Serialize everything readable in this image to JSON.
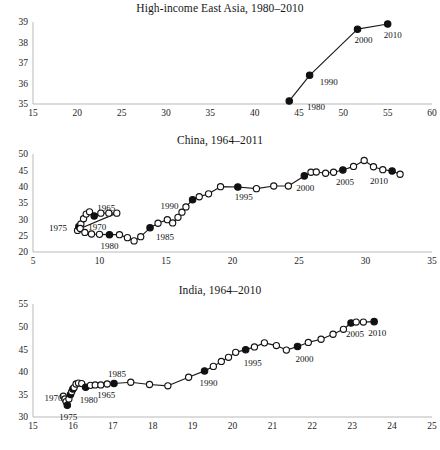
{
  "figure": {
    "background_color": "#ffffff",
    "line_color": "#1a1a1a",
    "marker_open_fill": "#ffffff",
    "marker_filled_fill": "#111111",
    "axis_color": "#b9b9b9"
  },
  "panels": [
    {
      "id": "high-income-east-asia",
      "title": "High-income East Asia, 1980–2010",
      "xticks": [
        "15",
        "20",
        "25",
        "30",
        "35",
        "40",
        "45",
        "50",
        "55",
        "60"
      ],
      "yticks": [
        "35",
        "36",
        "37",
        "38",
        "39"
      ]
    },
    {
      "id": "china",
      "title": "China, 1964–2011",
      "xticks": [
        "5",
        "10",
        "15",
        "20",
        "25",
        "30",
        "35"
      ],
      "yticks": [
        "20",
        "25",
        "30",
        "35",
        "40",
        "45",
        "50"
      ]
    },
    {
      "id": "india",
      "title": "India, 1964–2010",
      "xticks": [
        "15",
        "16",
        "17",
        "18",
        "19",
        "20",
        "21",
        "22",
        "23",
        "24",
        "25"
      ],
      "yticks": [
        "30",
        "35",
        "40",
        "45",
        "50",
        "55"
      ]
    }
  ],
  "chart_data": [
    {
      "type": "line",
      "title": "High-income East Asia, 1980–2010",
      "xlabel": "",
      "ylabel": "",
      "xlim": [
        15,
        60
      ],
      "ylim": [
        35,
        39
      ],
      "xticks": [
        15,
        20,
        25,
        30,
        35,
        40,
        45,
        50,
        55,
        60
      ],
      "yticks": [
        35,
        36,
        37,
        38,
        39
      ],
      "grid": false,
      "legend": "none",
      "marker_styles": {
        "open": "unlabeled year",
        "filled": "labeled decade marker"
      },
      "series": [
        {
          "name": "High-income East Asia",
          "points": [
            {
              "x": 43.9,
              "y": 35.15,
              "filled": true,
              "label": "1980"
            },
            {
              "x": 46.2,
              "y": 36.4,
              "filled": true,
              "label": "1990"
            },
            {
              "x": 51.6,
              "y": 38.65,
              "filled": true,
              "label": "2000"
            },
            {
              "x": 55.0,
              "y": 38.9,
              "filled": true,
              "label": "2010"
            }
          ]
        }
      ],
      "annotations": [
        "1980",
        "1990",
        "2000",
        "2010"
      ]
    },
    {
      "type": "line",
      "title": "China, 1964–2011",
      "xlabel": "",
      "ylabel": "",
      "xlim": [
        5,
        35
      ],
      "ylim": [
        20,
        50
      ],
      "xticks": [
        5,
        10,
        15,
        20,
        25,
        30,
        35
      ],
      "yticks": [
        20,
        25,
        30,
        35,
        40,
        45,
        50
      ],
      "grid": false,
      "legend": "none",
      "marker_styles": {
        "open": "unlabeled year",
        "filled": "labeled 5-year marker"
      },
      "series": [
        {
          "name": "China",
          "points": [
            {
              "x": 8.35,
              "y": 26.6,
              "filled": false,
              "label": null
            },
            {
              "x": 8.45,
              "y": 27.8,
              "filled": true,
              "label": "1975"
            },
            {
              "x": 8.6,
              "y": 28.6,
              "filled": false,
              "label": null
            },
            {
              "x": 8.8,
              "y": 30.2,
              "filled": false,
              "label": null
            },
            {
              "x": 9.0,
              "y": 31.6,
              "filled": false,
              "label": null
            },
            {
              "x": 9.25,
              "y": 32.3,
              "filled": false,
              "label": null
            },
            {
              "x": 9.6,
              "y": 31.0,
              "filled": true,
              "label": "1965"
            },
            {
              "x": 10.1,
              "y": 31.9,
              "filled": false,
              "label": null
            },
            {
              "x": 10.7,
              "y": 31.9,
              "filled": false,
              "label": null
            },
            {
              "x": 11.3,
              "y": 31.9,
              "filled": false,
              "label": null
            },
            {
              "x": 8.55,
              "y": 27.2,
              "filled": false,
              "label": null
            },
            {
              "x": 8.9,
              "y": 26.0,
              "filled": false,
              "label": null
            },
            {
              "x": 9.4,
              "y": 25.5,
              "filled": false,
              "label": null
            },
            {
              "x": 10.0,
              "y": 25.4,
              "filled": false,
              "label": null
            },
            {
              "x": 10.75,
              "y": 25.3,
              "filled": true,
              "label": "1980"
            },
            {
              "x": 11.5,
              "y": 25.3,
              "filled": false,
              "label": null
            },
            {
              "x": 12.1,
              "y": 24.4,
              "filled": false,
              "label": null
            },
            {
              "x": 12.6,
              "y": 23.4,
              "filled": false,
              "label": null
            },
            {
              "x": 13.1,
              "y": 24.7,
              "filled": false,
              "label": null
            },
            {
              "x": 13.8,
              "y": 27.4,
              "filled": true,
              "label": "1985"
            },
            {
              "x": 14.4,
              "y": 28.8,
              "filled": false,
              "label": null
            },
            {
              "x": 15.1,
              "y": 29.9,
              "filled": false,
              "label": null
            },
            {
              "x": 15.5,
              "y": 28.9,
              "filled": false,
              "label": null
            },
            {
              "x": 15.9,
              "y": 30.6,
              "filled": false,
              "label": null
            },
            {
              "x": 16.2,
              "y": 32.2,
              "filled": false,
              "label": null
            },
            {
              "x": 16.5,
              "y": 33.8,
              "filled": false,
              "label": null
            },
            {
              "x": 17.0,
              "y": 36.0,
              "filled": true,
              "label": "1990"
            },
            {
              "x": 17.5,
              "y": 36.9,
              "filled": false,
              "label": null
            },
            {
              "x": 18.2,
              "y": 37.8,
              "filled": false,
              "label": null
            },
            {
              "x": 19.1,
              "y": 40.0,
              "filled": false,
              "label": null
            },
            {
              "x": 20.4,
              "y": 39.9,
              "filled": true,
              "label": "1995"
            },
            {
              "x": 21.8,
              "y": 39.4,
              "filled": false,
              "label": null
            },
            {
              "x": 23.1,
              "y": 40.2,
              "filled": false,
              "label": null
            },
            {
              "x": 24.2,
              "y": 40.2,
              "filled": false,
              "label": null
            },
            {
              "x": 25.4,
              "y": 43.3,
              "filled": true,
              "label": "2000"
            },
            {
              "x": 25.9,
              "y": 44.4,
              "filled": false,
              "label": null
            },
            {
              "x": 26.3,
              "y": 44.5,
              "filled": false,
              "label": null
            },
            {
              "x": 27.0,
              "y": 44.1,
              "filled": false,
              "label": null
            },
            {
              "x": 27.6,
              "y": 44.4,
              "filled": false,
              "label": null
            },
            {
              "x": 28.3,
              "y": 45.1,
              "filled": true,
              "label": "2005"
            },
            {
              "x": 29.1,
              "y": 46.2,
              "filled": false,
              "label": null
            },
            {
              "x": 29.9,
              "y": 48.0,
              "filled": false,
              "label": null
            },
            {
              "x": 30.6,
              "y": 46.1,
              "filled": false,
              "label": null
            },
            {
              "x": 31.3,
              "y": 45.2,
              "filled": false,
              "label": null
            },
            {
              "x": 32.0,
              "y": 44.8,
              "filled": true,
              "label": "2010"
            },
            {
              "x": 32.6,
              "y": 43.8,
              "filled": false,
              "label": null
            }
          ]
        }
      ],
      "annotations": [
        "1965",
        "1970",
        "1975",
        "1980",
        "1985",
        "1990",
        "1995",
        "2000",
        "2005",
        "2010"
      ]
    },
    {
      "type": "line",
      "title": "India, 1964–2010",
      "xlabel": "",
      "ylabel": "",
      "xlim": [
        15,
        25
      ],
      "ylim": [
        30,
        55
      ],
      "xticks": [
        15,
        16,
        17,
        18,
        19,
        20,
        21,
        22,
        23,
        24,
        25
      ],
      "yticks": [
        30,
        35,
        40,
        45,
        50,
        55
      ],
      "grid": false,
      "legend": "none",
      "marker_styles": {
        "open": "unlabeled year",
        "filled": "labeled 5-year marker"
      },
      "series": [
        {
          "name": "India",
          "points": [
            {
              "x": 15.76,
              "y": 34.6,
              "filled": false,
              "label": null
            },
            {
              "x": 15.8,
              "y": 34.0,
              "filled": false,
              "label": null
            },
            {
              "x": 15.83,
              "y": 33.4,
              "filled": false,
              "label": null
            },
            {
              "x": 15.86,
              "y": 32.6,
              "filled": true,
              "label": "1975"
            },
            {
              "x": 15.9,
              "y": 34.0,
              "filled": false,
              "label": null
            },
            {
              "x": 15.94,
              "y": 35.0,
              "filled": true,
              "label": "1970"
            },
            {
              "x": 15.97,
              "y": 35.6,
              "filled": false,
              "label": null
            },
            {
              "x": 16.0,
              "y": 36.2,
              "filled": true,
              "label": null
            },
            {
              "x": 16.03,
              "y": 36.5,
              "filled": false,
              "label": null
            },
            {
              "x": 16.08,
              "y": 37.3,
              "filled": false,
              "label": null
            },
            {
              "x": 16.14,
              "y": 37.5,
              "filled": false,
              "label": null
            },
            {
              "x": 16.22,
              "y": 37.4,
              "filled": false,
              "label": null
            },
            {
              "x": 16.32,
              "y": 36.6,
              "filled": true,
              "label": "1980"
            },
            {
              "x": 16.44,
              "y": 37.0,
              "filled": false,
              "label": null
            },
            {
              "x": 16.56,
              "y": 37.1,
              "filled": false,
              "label": null
            },
            {
              "x": 16.7,
              "y": 37.1,
              "filled": false,
              "label": null
            },
            {
              "x": 16.86,
              "y": 37.3,
              "filled": false,
              "label": null
            },
            {
              "x": 17.03,
              "y": 37.4,
              "filled": true,
              "label": "1985"
            },
            {
              "x": 17.45,
              "y": 37.7,
              "filled": false,
              "label": null
            },
            {
              "x": 17.92,
              "y": 37.2,
              "filled": false,
              "label": null
            },
            {
              "x": 18.38,
              "y": 36.9,
              "filled": false,
              "label": null
            },
            {
              "x": 18.9,
              "y": 38.8,
              "filled": false,
              "label": null
            },
            {
              "x": 19.3,
              "y": 40.2,
              "filled": true,
              "label": "1990"
            },
            {
              "x": 19.52,
              "y": 41.2,
              "filled": false,
              "label": null
            },
            {
              "x": 19.72,
              "y": 42.3,
              "filled": false,
              "label": null
            },
            {
              "x": 19.9,
              "y": 43.2,
              "filled": false,
              "label": null
            },
            {
              "x": 20.08,
              "y": 44.3,
              "filled": false,
              "label": null
            },
            {
              "x": 20.33,
              "y": 44.9,
              "filled": true,
              "label": "1995"
            },
            {
              "x": 20.55,
              "y": 45.5,
              "filled": false,
              "label": null
            },
            {
              "x": 20.8,
              "y": 46.4,
              "filled": false,
              "label": null
            },
            {
              "x": 21.1,
              "y": 45.8,
              "filled": false,
              "label": null
            },
            {
              "x": 21.35,
              "y": 44.8,
              "filled": false,
              "label": null
            },
            {
              "x": 21.63,
              "y": 45.6,
              "filled": true,
              "label": "2000"
            },
            {
              "x": 21.9,
              "y": 46.5,
              "filled": false,
              "label": null
            },
            {
              "x": 22.22,
              "y": 47.2,
              "filled": false,
              "label": null
            },
            {
              "x": 22.52,
              "y": 48.3,
              "filled": false,
              "label": null
            },
            {
              "x": 22.78,
              "y": 49.4,
              "filled": false,
              "label": null
            },
            {
              "x": 22.97,
              "y": 50.8,
              "filled": true,
              "label": "2005"
            },
            {
              "x": 23.1,
              "y": 51.0,
              "filled": false,
              "label": null
            },
            {
              "x": 23.28,
              "y": 51.0,
              "filled": false,
              "label": null
            },
            {
              "x": 23.55,
              "y": 51.1,
              "filled": true,
              "label": "2010"
            }
          ]
        }
      ],
      "annotations": [
        "1965",
        "1970",
        "1975",
        "1980",
        "1985",
        "1990",
        "1995",
        "2000",
        "2005",
        "2010"
      ]
    }
  ],
  "label_positions": {
    "panel0": [
      {
        "text": "1980",
        "x": 45.0,
        "y": 35.15,
        "dx": 8,
        "dy": 9
      },
      {
        "text": "1990",
        "x": 46.2,
        "y": 36.4,
        "dx": 10,
        "dy": 10
      },
      {
        "text": "2000",
        "x": 51.6,
        "y": 38.65,
        "dx": -3,
        "dy": 14
      },
      {
        "text": "2010",
        "x": 55.0,
        "y": 38.9,
        "dx": -4,
        "dy": 14
      }
    ],
    "panel1": [
      {
        "text": "1965",
        "x": 9.6,
        "y": 31.0,
        "dx": 3,
        "dy": -5
      },
      {
        "text": "1970",
        "x": 9.0,
        "y": 28.6,
        "dx": 2,
        "dy": 6
      },
      {
        "text": "1975",
        "x": 8.45,
        "y": 27.8,
        "dx": -30,
        "dy": 4
      },
      {
        "text": "1980",
        "x": 10.75,
        "y": 25.3,
        "dx": -9,
        "dy": 14
      },
      {
        "text": "1985",
        "x": 13.8,
        "y": 27.4,
        "dx": 6,
        "dy": 12
      },
      {
        "text": "1990",
        "x": 17.0,
        "y": 36.0,
        "dx": -32,
        "dy": 9
      },
      {
        "text": "1995",
        "x": 20.4,
        "y": 39.9,
        "dx": -3,
        "dy": 13
      },
      {
        "text": "2000",
        "x": 25.4,
        "y": 43.3,
        "dx": -8,
        "dy": 15
      },
      {
        "text": "2005",
        "x": 28.3,
        "y": 45.1,
        "dx": -7,
        "dy": 15
      },
      {
        "text": "2010",
        "x": 32.0,
        "y": 44.8,
        "dx": -22,
        "dy": 13
      }
    ],
    "panel2": [
      {
        "text": "1965",
        "x": 16.56,
        "y": 37.1,
        "dx": 2,
        "dy": 13
      },
      {
        "text": "1970",
        "x": 15.94,
        "y": 35.0,
        "dx": -26,
        "dy": 7
      },
      {
        "text": "1975",
        "x": 15.86,
        "y": 32.6,
        "dx": -8,
        "dy": 15
      },
      {
        "text": "1980",
        "x": 16.32,
        "y": 36.6,
        "dx": -6,
        "dy": 16
      },
      {
        "text": "1985",
        "x": 17.03,
        "y": 37.4,
        "dx": -6,
        "dy": -7
      },
      {
        "text": "1990",
        "x": 19.3,
        "y": 40.2,
        "dx": -5,
        "dy": 15
      },
      {
        "text": "1995",
        "x": 20.33,
        "y": 44.9,
        "dx": -2,
        "dy": 16
      },
      {
        "text": "2000",
        "x": 21.63,
        "y": 45.6,
        "dx": -2,
        "dy": 16
      },
      {
        "text": "2005",
        "x": 22.97,
        "y": 50.8,
        "dx": -5,
        "dy": 14
      },
      {
        "text": "2010",
        "x": 23.55,
        "y": 51.1,
        "dx": -6,
        "dy": 14
      }
    ]
  }
}
